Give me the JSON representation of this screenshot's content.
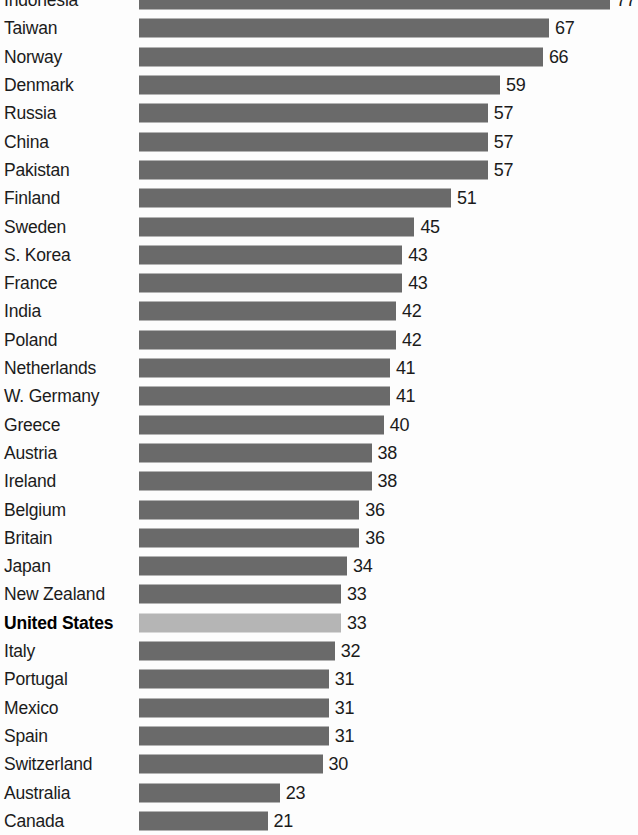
{
  "chart_data": {
    "type": "bar",
    "orientation": "horizontal",
    "title": "",
    "subtitle": "",
    "xlabel": "",
    "ylabel": "",
    "grid": false,
    "legend": false,
    "xlim": [
      0,
      77
    ],
    "value_labels_shown": true,
    "highlight_category": "United States",
    "colors": {
      "bar": "#6a6a6a",
      "bar_highlight": "#b5b5b5",
      "text": "#1b1b1b",
      "background": "#fdfdfd"
    },
    "categories": [
      "Indonesia",
      "Taiwan",
      "Norway",
      "Denmark",
      "Russia",
      "China",
      "Pakistan",
      "Finland",
      "Sweden",
      "S. Korea",
      "France",
      "India",
      "Poland",
      "Netherlands",
      "W. Germany",
      "Greece",
      "Austria",
      "Ireland",
      "Belgium",
      "Britain",
      "Japan",
      "New Zealand",
      "United States",
      "Italy",
      "Portugal",
      "Mexico",
      "Spain",
      "Switzerland",
      "Australia",
      "Canada"
    ],
    "values": [
      77,
      67,
      66,
      59,
      57,
      57,
      57,
      51,
      45,
      43,
      43,
      42,
      42,
      41,
      41,
      40,
      38,
      38,
      36,
      36,
      34,
      33,
      33,
      32,
      31,
      31,
      31,
      30,
      23,
      21
    ],
    "rows": [
      {
        "label": "Indonesia",
        "value": 77,
        "value_text": "77",
        "highlight": false
      },
      {
        "label": "Taiwan",
        "value": 67,
        "value_text": "67",
        "highlight": false
      },
      {
        "label": "Norway",
        "value": 66,
        "value_text": "66",
        "highlight": false
      },
      {
        "label": "Denmark",
        "value": 59,
        "value_text": "59",
        "highlight": false
      },
      {
        "label": "Russia",
        "value": 57,
        "value_text": "57",
        "highlight": false
      },
      {
        "label": "China",
        "value": 57,
        "value_text": "57",
        "highlight": false
      },
      {
        "label": "Pakistan",
        "value": 57,
        "value_text": "57",
        "highlight": false
      },
      {
        "label": "Finland",
        "value": 51,
        "value_text": "51",
        "highlight": false
      },
      {
        "label": "Sweden",
        "value": 45,
        "value_text": "45",
        "highlight": false
      },
      {
        "label": "S. Korea",
        "value": 43,
        "value_text": "43",
        "highlight": false
      },
      {
        "label": "France",
        "value": 43,
        "value_text": "43",
        "highlight": false
      },
      {
        "label": "India",
        "value": 42,
        "value_text": "42",
        "highlight": false
      },
      {
        "label": "Poland",
        "value": 42,
        "value_text": "42",
        "highlight": false
      },
      {
        "label": "Netherlands",
        "value": 41,
        "value_text": "41",
        "highlight": false
      },
      {
        "label": "W. Germany",
        "value": 41,
        "value_text": "41",
        "highlight": false
      },
      {
        "label": "Greece",
        "value": 40,
        "value_text": "40",
        "highlight": false
      },
      {
        "label": "Austria",
        "value": 38,
        "value_text": "38",
        "highlight": false
      },
      {
        "label": "Ireland",
        "value": 38,
        "value_text": "38",
        "highlight": false
      },
      {
        "label": "Belgium",
        "value": 36,
        "value_text": "36",
        "highlight": false
      },
      {
        "label": "Britain",
        "value": 36,
        "value_text": "36",
        "highlight": false
      },
      {
        "label": "Japan",
        "value": 34,
        "value_text": "34",
        "highlight": false
      },
      {
        "label": "New Zealand",
        "value": 33,
        "value_text": "33",
        "highlight": false
      },
      {
        "label": "United States",
        "value": 33,
        "value_text": "33",
        "highlight": true
      },
      {
        "label": "Italy",
        "value": 32,
        "value_text": "32",
        "highlight": false
      },
      {
        "label": "Portugal",
        "value": 31,
        "value_text": "31",
        "highlight": false
      },
      {
        "label": "Mexico",
        "value": 31,
        "value_text": "31",
        "highlight": false
      },
      {
        "label": "Spain",
        "value": 31,
        "value_text": "31",
        "highlight": false
      },
      {
        "label": "Switzerland",
        "value": 30,
        "value_text": "30",
        "highlight": false
      },
      {
        "label": "Australia",
        "value": 23,
        "value_text": "23",
        "highlight": false
      },
      {
        "label": "Canada",
        "value": 21,
        "value_text": "21",
        "highlight": false
      }
    ]
  },
  "layout": {
    "bar_origin_x": 139,
    "px_per_unit": 6.12,
    "row_pitch": 28.3,
    "row_top_offset": -14,
    "bar_height": 19,
    "value_gap": 6
  }
}
